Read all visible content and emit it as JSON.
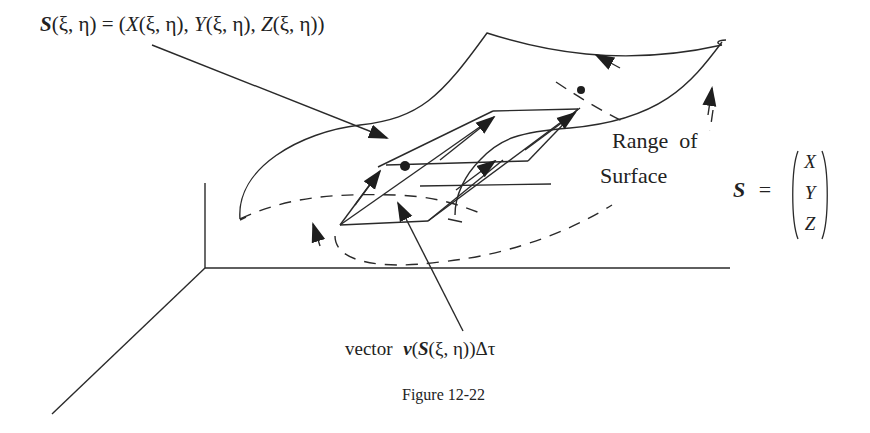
{
  "figure": {
    "caption": "Figure 12-22",
    "labels": {
      "surface_param": "S(ξ, η) = (X(ξ, η), Y(ξ, η), Z(ξ, η))",
      "surface_param_parts": {
        "s": "S",
        "args": "(ξ, η)",
        "eq": " = (",
        "x": "X",
        "y": "Y",
        "z": "Z",
        "sep": ", ",
        "close": ")"
      },
      "range_line1": "Range  of",
      "range_line2": "Surface",
      "vector_label": {
        "word": "vector",
        "v": "v",
        "open": "(",
        "s": "S",
        "args": "(ξ, η))Δτ"
      },
      "matrix": {
        "lhs": "S",
        "eq": "=",
        "entries": [
          "X",
          "Y",
          "Z"
        ]
      }
    },
    "colors": {
      "stroke": "#2a2a2a",
      "background": "#ffffff"
    }
  }
}
